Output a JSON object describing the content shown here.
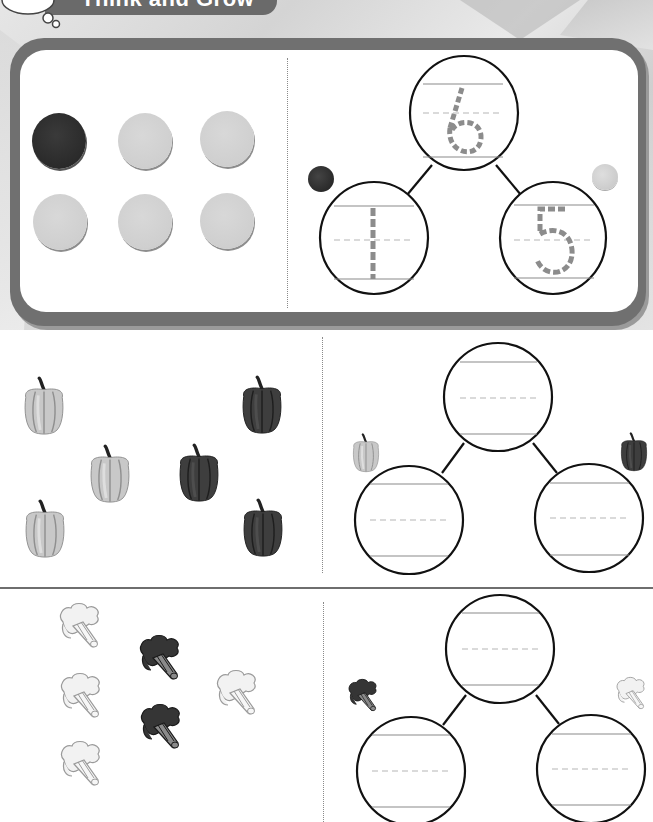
{
  "header": {
    "title": "Think and Grow"
  },
  "example": {
    "counters": [
      {
        "color": "dark"
      },
      {
        "color": "light"
      },
      {
        "color": "light"
      },
      {
        "color": "light"
      },
      {
        "color": "light"
      },
      {
        "color": "light"
      }
    ],
    "number_bond": {
      "whole": "6",
      "part_left": "1",
      "part_right": "5"
    },
    "left_marker": "dark-counter",
    "right_marker": "light-counter"
  },
  "exercises": [
    {
      "item": "pepper",
      "objects": [
        {
          "shade": "light"
        },
        {
          "shade": "light"
        },
        {
          "shade": "light"
        },
        {
          "shade": "dark"
        },
        {
          "shade": "dark"
        },
        {
          "shade": "dark"
        }
      ],
      "number_bond": {
        "whole": "",
        "part_left": "",
        "part_right": ""
      },
      "left_marker": "light-pepper",
      "right_marker": "dark-pepper"
    },
    {
      "item": "broccoli",
      "objects": [
        {
          "shade": "light"
        },
        {
          "shade": "light"
        },
        {
          "shade": "light"
        },
        {
          "shade": "light"
        },
        {
          "shade": "dark"
        },
        {
          "shade": "dark"
        }
      ],
      "number_bond": {
        "whole": "",
        "part_left": "",
        "part_right": ""
      },
      "left_marker": "dark-broccoli",
      "right_marker": "light-broccoli"
    }
  ],
  "colors": {
    "card_border": "#707070",
    "header_pill": "#6a6a6a",
    "dark_counter": "#2a2a2a",
    "light_counter": "#cfcfcf",
    "trace_digit": "#8c8c8c",
    "guide_line": "#8a8a8a",
    "guide_dash": "#b5b5b5"
  }
}
